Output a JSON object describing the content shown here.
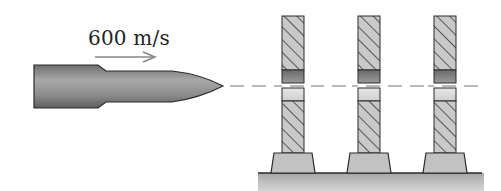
{
  "diagram": {
    "velocity_label": "600 m/s",
    "bullet": {
      "name": "bullet",
      "direction": "right"
    },
    "posts": [
      {
        "id": 1,
        "name": "post-1"
      },
      {
        "id": 2,
        "name": "post-2"
      },
      {
        "id": 3,
        "name": "post-3"
      }
    ],
    "trajectory": "dashed line through posts",
    "ground": "hatched ground surface",
    "colors": {
      "outline": "#2a2a2a",
      "bullet_fill": "#8a8a8a",
      "post_hatch_bg": "#c8c8c8",
      "post_dark_band": "#7a7a7a",
      "post_light_band": "#dcdcdc",
      "base_fill": "#bdbdbd",
      "ground_fill": "#b8b8b8",
      "arrow": "#888888",
      "dash": "#999999"
    }
  }
}
